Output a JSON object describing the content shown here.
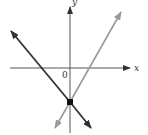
{
  "figure": {
    "axes": {
      "x_label": "x",
      "y_label": "y",
      "origin_label": "0",
      "axis_color": "#555555"
    },
    "lines": [
      {
        "name": "decreasing-line",
        "slope_sign": "negative",
        "color": "#333333",
        "through": "y-intercept point",
        "arrows": "both ends"
      },
      {
        "name": "increasing-line",
        "slope_sign": "positive",
        "color": "#999999",
        "through": "y-intercept point",
        "arrows": "both ends"
      }
    ],
    "intersection_point": {
      "location": "on negative y-axis",
      "color": "#111111"
    }
  }
}
